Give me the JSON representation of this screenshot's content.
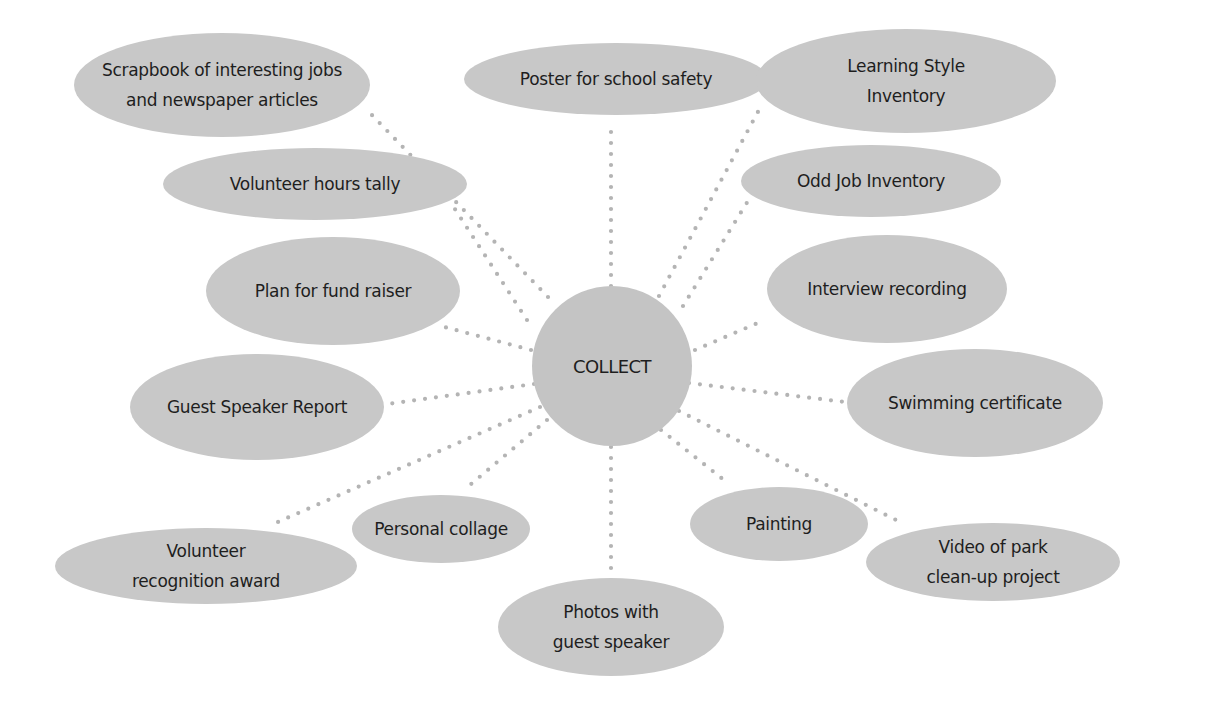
{
  "diagram": {
    "type": "spider-map",
    "colors": {
      "background": "#ffffff",
      "node_fill": "#c8c8c8",
      "center_fill": "#c4c4c4",
      "connector": "#b4b4b4",
      "text": "#1e1e1e"
    },
    "center": {
      "label": "COLLECT",
      "cx": 612,
      "cy": 366,
      "r": 80
    },
    "nodes": [
      {
        "id": "scrapbook",
        "lines": [
          "Scrapbook of interesting jobs",
          "and newspaper articles"
        ],
        "cx": 222,
        "cy": 85,
        "rx": 148,
        "ry": 52,
        "anchor": [
          367,
          110
        ]
      },
      {
        "id": "poster",
        "lines": [
          "Poster for school safety"
        ],
        "cx": 616,
        "cy": 79,
        "rx": 152,
        "ry": 36,
        "anchor": [
          611,
          124
        ]
      },
      {
        "id": "learning-style",
        "lines": [
          "Learning Style",
          "Inventory"
        ],
        "cx": 906,
        "cy": 81,
        "rx": 150,
        "ry": 52,
        "anchor": [
          760,
          108
        ]
      },
      {
        "id": "volunteer-hours",
        "lines": [
          "Volunteer hours tally"
        ],
        "cx": 315,
        "cy": 184,
        "rx": 152,
        "ry": 36,
        "anchor": [
          451,
          203
        ]
      },
      {
        "id": "odd-job",
        "lines": [
          "Odd Job Inventory"
        ],
        "cx": 871,
        "cy": 181,
        "rx": 130,
        "ry": 36,
        "anchor": [
          748,
          201
        ]
      },
      {
        "id": "fund-raiser",
        "lines": [
          "Plan for fund raiser"
        ],
        "cx": 333,
        "cy": 291,
        "rx": 127,
        "ry": 54,
        "anchor": [
          437,
          325
        ]
      },
      {
        "id": "interview",
        "lines": [
          "Interview recording"
        ],
        "cx": 887,
        "cy": 289,
        "rx": 120,
        "ry": 54,
        "anchor": [
          760,
          322
        ]
      },
      {
        "id": "guest-speaker",
        "lines": [
          "Guest Speaker Report"
        ],
        "cx": 257,
        "cy": 407,
        "rx": 127,
        "ry": 53,
        "anchor": [
          387,
          404
        ]
      },
      {
        "id": "swimming",
        "lines": [
          "Swimming certificate"
        ],
        "cx": 975,
        "cy": 403,
        "rx": 128,
        "ry": 54,
        "anchor": [
          845,
          402
        ]
      },
      {
        "id": "personal-collage",
        "lines": [
          "Personal collage"
        ],
        "cx": 441,
        "cy": 529,
        "rx": 89,
        "ry": 34,
        "anchor": [
          470,
          485
        ]
      },
      {
        "id": "painting",
        "lines": [
          "Painting"
        ],
        "cx": 779,
        "cy": 524,
        "rx": 89,
        "ry": 37,
        "anchor": [
          729,
          484
        ]
      },
      {
        "id": "volunteer-recognition",
        "lines": [
          "Volunteer",
          "recognition award"
        ],
        "cx": 206,
        "cy": 566,
        "rx": 151,
        "ry": 38,
        "anchor": [
          271,
          525
        ]
      },
      {
        "id": "video",
        "lines": [
          "Video of park",
          "clean-up project"
        ],
        "cx": 993,
        "cy": 562,
        "rx": 127,
        "ry": 39,
        "anchor": [
          900,
          522
        ]
      },
      {
        "id": "photos",
        "lines": [
          "Photos with",
          "guest speaker"
        ],
        "cx": 611,
        "cy": 627,
        "rx": 113,
        "ry": 49,
        "anchor": [
          611,
          569
        ]
      }
    ],
    "connector_origins": {
      "scrapbook": [
        548,
        297
      ],
      "poster": [
        611,
        286
      ],
      "learning-style": [
        659,
        296
      ],
      "volunteer-hours": [
        527,
        320
      ],
      "odd-job": [
        683,
        306
      ],
      "fund-raiser": [
        531,
        350
      ],
      "interview": [
        695,
        350
      ],
      "guest-speaker": [
        534,
        384
      ],
      "swimming": [
        689,
        383
      ],
      "personal-collage": [
        547,
        420
      ],
      "painting": [
        661,
        430
      ],
      "volunteer-recognition": [
        540,
        407
      ],
      "video": [
        679,
        411
      ],
      "photos": [
        611,
        447
      ]
    }
  }
}
